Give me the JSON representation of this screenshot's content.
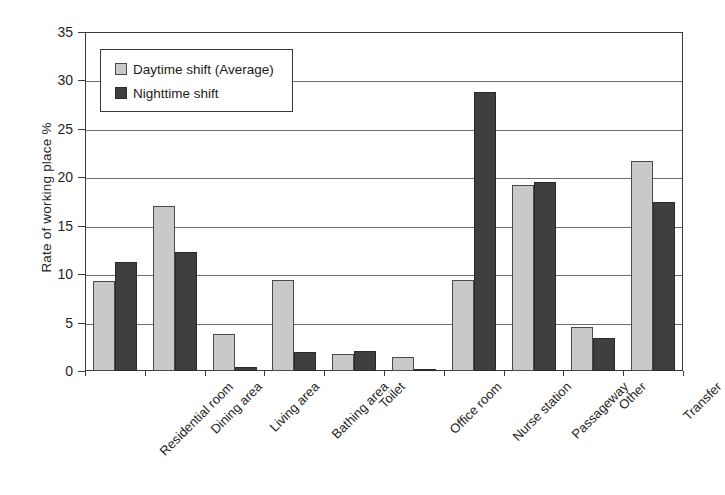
{
  "chart_data": {
    "type": "bar",
    "title": "",
    "xlabel": "",
    "ylabel": "Rate of working place  %",
    "ylim": [
      0,
      35
    ],
    "yticks": [
      0,
      5,
      10,
      15,
      20,
      25,
      30,
      35
    ],
    "ytick_labels": [
      "0",
      "5",
      "10",
      "15",
      "20",
      "25",
      "30",
      "35"
    ],
    "grid": true,
    "legend_position": "upper-left-inside",
    "categories": [
      "Residential room",
      "Dining area",
      "Living area",
      "Bathing area",
      "Toilet",
      "Office room",
      "Nurse station",
      "Passageway",
      "Other",
      "Transfer"
    ],
    "series": [
      {
        "name": "Daytime shift (Average)",
        "color": "#c9c9c9",
        "values": [
          9.3,
          17.0,
          3.8,
          9.4,
          1.8,
          1.4,
          9.4,
          19.2,
          4.5,
          21.7
        ]
      },
      {
        "name": "Nighttime shift",
        "color": "#3f3f3f",
        "values": [
          11.3,
          12.3,
          0.4,
          2.0,
          2.1,
          0.1,
          28.8,
          19.5,
          3.4,
          17.5
        ]
      }
    ]
  },
  "legend": {
    "items": [
      {
        "label": "Daytime shift (Average)",
        "swatch": "daytime"
      },
      {
        "label": "Nighttime shift",
        "swatch": "nighttime"
      }
    ]
  }
}
